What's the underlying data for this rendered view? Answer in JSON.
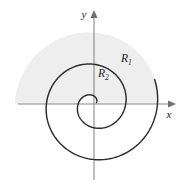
{
  "figure": {
    "kind": "polar-spiral-region-diagram",
    "width": 188,
    "height": 184,
    "background_color": "#ffffff"
  },
  "axes": {
    "x_label": "x",
    "y_label": "y",
    "axis_color": "#8a8a8a",
    "arrow_color": "#6f6f6f",
    "origin": {
      "x": 94,
      "y": 104
    },
    "x_extent": {
      "min": 18,
      "max": 172
    },
    "y_extent": {
      "min": 14,
      "max": 180
    }
  },
  "regions": [
    {
      "name": "R1",
      "label_text": "R",
      "label_subscript": "1",
      "label_x": 124,
      "label_y": 60,
      "fill_color": "#eeeeee"
    },
    {
      "name": "R2",
      "label_text": "R",
      "label_subscript": "2",
      "label_x": 101,
      "label_y": 75,
      "fill_color": "#eeeeee"
    }
  ],
  "curve": {
    "type": "archimedean-spiral",
    "equation": "r = a*theta",
    "stroke_color": "#2b2b2b",
    "stroke_width": 1.45,
    "turns": 2,
    "a_per_radian": 5.05,
    "theta_start": 0.55,
    "theta_end": 12.95,
    "direction": "counterclockwise",
    "x_axis_crossings_right": [
      12,
      40,
      67
    ],
    "x_axis_crossings_left": [
      26,
      54
    ],
    "y_axis_crossing_top": [
      30,
      58
    ],
    "y_axis_crossing_bottom": [
      18,
      45
    ]
  },
  "chart_data": {
    "type": "line",
    "title": "",
    "xlabel": "x",
    "ylabel": "y",
    "grid": false,
    "legend": "none",
    "series": [
      {
        "name": "Archimedean spiral r = aθ",
        "polar": true,
        "theta_min": 0.55,
        "theta_max": 12.95,
        "r_of_theta_coefficient": 5.05
      }
    ],
    "annotations": [
      {
        "text": "R₁",
        "x": 124,
        "y": 60
      },
      {
        "text": "R₂",
        "x": 101,
        "y": 75
      }
    ]
  }
}
